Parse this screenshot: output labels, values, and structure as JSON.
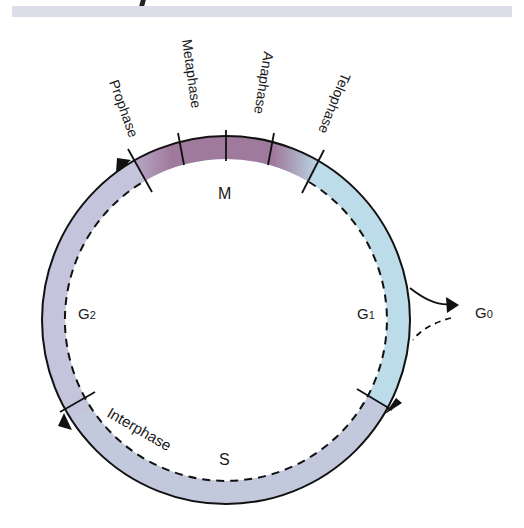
{
  "header": {
    "banner_color": "#dcdde8"
  },
  "diagram": {
    "center": [
      226,
      320
    ],
    "outer_radius": 184,
    "inner_radius": 161,
    "colors": {
      "mitosis": "#a07a9c",
      "g1": "#bcdcea",
      "s": "#c2c6d8",
      "g2": "#c4c5dc",
      "stroke": "#111111"
    },
    "mitosis_label": "M",
    "mitosis_phases": [
      {
        "label": "Prophase"
      },
      {
        "label": "Metaphase"
      },
      {
        "label": "Anaphase"
      },
      {
        "label": "Telophase"
      }
    ],
    "interphase_label": "Interphase",
    "stages": {
      "g1": {
        "letter": "G",
        "sub": "1"
      },
      "s": {
        "letter": "S"
      },
      "g2": {
        "letter": "G",
        "sub": "2"
      },
      "g0": {
        "letter": "G",
        "sub": "0"
      }
    }
  }
}
